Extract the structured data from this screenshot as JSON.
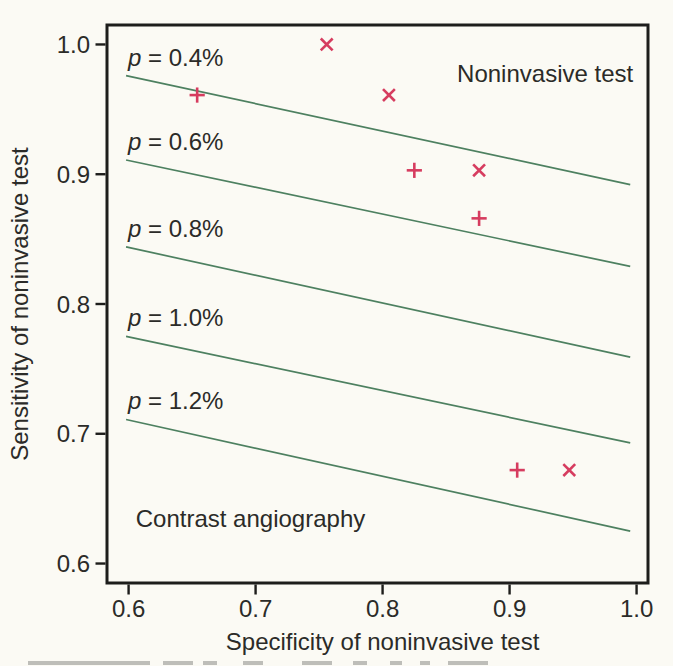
{
  "figure": {
    "background": "#fbfaf4",
    "frame_color": "#1d1d1b",
    "text_color": "#2b2b28",
    "caption_fragment_color": "#8d8d88"
  },
  "chart_data": {
    "type": "scatter",
    "title": "",
    "xlabel": "Specificity of noninvasive test",
    "ylabel": "Sensitivity of noninvasive test",
    "xlim": [
      0.583,
      1.009
    ],
    "ylim": [
      0.585,
      1.015
    ],
    "grid": false,
    "legend": "none",
    "xtick_values": [
      0.6,
      0.7,
      0.8,
      0.9,
      1.0
    ],
    "xtick_labels": [
      "0.6",
      "0.7",
      "0.8",
      "0.9",
      "1.0"
    ],
    "ytick_values": [
      0.6,
      0.7,
      0.8,
      0.9,
      1.0
    ],
    "ytick_labels": [
      "0.6",
      "0.7",
      "0.8",
      "0.9",
      "1.0"
    ],
    "series": [
      {
        "name": "cross-markers",
        "marker": "x",
        "color": "#d63c5f",
        "points": [
          [
            0.756,
            1.0
          ],
          [
            0.805,
            0.961
          ],
          [
            0.876,
            0.903
          ],
          [
            0.947,
            0.672
          ]
        ]
      },
      {
        "name": "plus-markers",
        "marker": "+",
        "color": "#d63c5f",
        "points": [
          [
            0.654,
            0.961
          ],
          [
            0.825,
            0.903
          ],
          [
            0.876,
            0.866
          ],
          [
            0.906,
            0.672
          ]
        ]
      }
    ],
    "threshold_lines": {
      "color": "#4d8060",
      "lines": [
        {
          "label": "p = 0.4%",
          "x1": 0.598,
          "y1": 0.976,
          "x2": 0.995,
          "y2": 0.892
        },
        {
          "label": "p = 0.6%",
          "x1": 0.598,
          "y1": 0.911,
          "x2": 0.995,
          "y2": 0.829
        },
        {
          "label": "p = 0.8%",
          "x1": 0.598,
          "y1": 0.844,
          "x2": 0.995,
          "y2": 0.759
        },
        {
          "label": "p = 1.0%",
          "x1": 0.598,
          "y1": 0.775,
          "x2": 0.995,
          "y2": 0.693
        },
        {
          "label": "p = 1.2%",
          "x1": 0.598,
          "y1": 0.711,
          "x2": 0.995,
          "y2": 0.625
        }
      ]
    },
    "annotations": [
      {
        "name": "region-label-noninvasive-test",
        "text": "Noninvasive test",
        "x": 0.928,
        "y": 0.971,
        "anchor": "middle"
      },
      {
        "name": "region-label-contrast-angiography",
        "text": "Contrast angiography",
        "x": 0.696,
        "y": 0.628,
        "anchor": "middle"
      }
    ]
  }
}
